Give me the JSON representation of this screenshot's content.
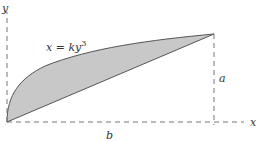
{
  "figure": {
    "labels": {
      "y_axis": "y",
      "x_axis": "x",
      "curve": "x = ky",
      "curve_exponent": "3",
      "height": "a",
      "width": "b"
    },
    "colors": {
      "fill": "#c8c8c8",
      "stroke": "#555555",
      "axis": "#777777"
    }
  }
}
